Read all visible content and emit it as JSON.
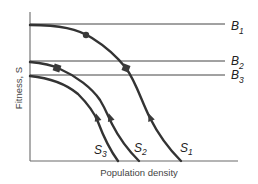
{
  "diagram": {
    "y_axis_label": "Fitness, S",
    "x_axis_label": "Population density",
    "horizontal_lines": [
      {
        "id": "B1",
        "letter": "B",
        "sub": "1",
        "y": 24
      },
      {
        "id": "B2",
        "letter": "B",
        "sub": "2",
        "y": 61
      },
      {
        "id": "B3",
        "letter": "B",
        "sub": "3",
        "y": 75
      }
    ],
    "curves": [
      {
        "id": "S1",
        "letter": "S",
        "sub": "1",
        "markers": [
          "circle",
          "square"
        ],
        "direction": "up"
      },
      {
        "id": "S2",
        "letter": "S",
        "sub": "2",
        "markers": [
          "square"
        ],
        "direction": "up"
      },
      {
        "id": "S3",
        "letter": "S",
        "sub": "3",
        "markers": [],
        "direction": "up"
      }
    ],
    "colors": {
      "curve": "#333333",
      "line": "#444444",
      "axis": "#6a6a6a",
      "background": "#ffffff"
    }
  }
}
